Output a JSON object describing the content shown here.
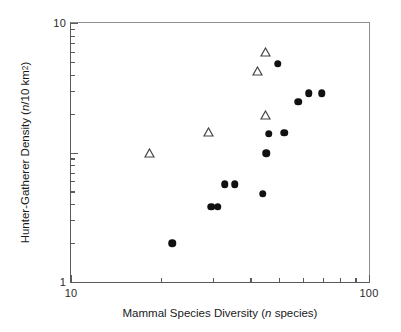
{
  "figure": {
    "width": 401,
    "height": 332,
    "background": "#ffffff"
  },
  "chart_data": {
    "type": "scatter",
    "title": "",
    "xlabel": "Mammal Species Diversity (n species)",
    "ylabel": "Hunter-Gatherer Density (n/10 km²)",
    "xscale": "log",
    "yscale": "log",
    "xlim": [
      10,
      100
    ],
    "ylim": [
      0.1,
      10
    ],
    "grid": false,
    "legend": "none",
    "xticks": [
      10,
      100
    ],
    "xtick_labels": [
      "10",
      "100"
    ],
    "xminor_ticks": [
      20,
      30,
      40,
      50,
      60,
      70,
      80,
      90
    ],
    "yticks": [
      0.1,
      1,
      10
    ],
    "ytick_labels": [
      "0.1",
      "1",
      "10"
    ],
    "yminor_ticks": [
      0.2,
      0.3,
      0.4,
      0.5,
      0.6,
      0.7,
      0.8,
      0.9,
      2,
      3,
      4,
      5,
      6,
      7,
      8,
      9
    ],
    "series": [
      {
        "name": "filled-circles",
        "marker": "circle",
        "fill": "#111111",
        "points": [
          {
            "x": 21.9,
            "y": 0.2
          },
          {
            "x": 29.6,
            "y": 0.38
          },
          {
            "x": 31.1,
            "y": 0.38
          },
          {
            "x": 32.8,
            "y": 0.57
          },
          {
            "x": 35.5,
            "y": 0.57
          },
          {
            "x": 44.0,
            "y": 0.48
          },
          {
            "x": 45.2,
            "y": 0.99
          },
          {
            "x": 46.0,
            "y": 1.4
          },
          {
            "x": 51.9,
            "y": 1.42
          },
          {
            "x": 49.4,
            "y": 4.85
          },
          {
            "x": 57.8,
            "y": 2.46
          },
          {
            "x": 62.9,
            "y": 2.86
          },
          {
            "x": 69.3,
            "y": 2.86
          }
        ]
      },
      {
        "name": "open-triangles",
        "marker": "triangle",
        "fill": "none",
        "edge": "#444444",
        "points": [
          {
            "x": 18.4,
            "y": 1.0
          },
          {
            "x": 29.0,
            "y": 1.43
          },
          {
            "x": 42.3,
            "y": 4.25
          },
          {
            "x": 44.9,
            "y": 6.02
          },
          {
            "x": 45.0,
            "y": 1.96
          }
        ]
      }
    ]
  },
  "axes": {
    "x_title_prefix": "Mammal Species Diversity (",
    "x_title_italic": "n",
    "x_title_suffix": " species)",
    "y_title_prefix": "Hunter-Gatherer Density (",
    "y_title_italic": "n",
    "y_title_mid": "/10 km",
    "y_title_sup": "2",
    "y_title_suffix": ")"
  }
}
